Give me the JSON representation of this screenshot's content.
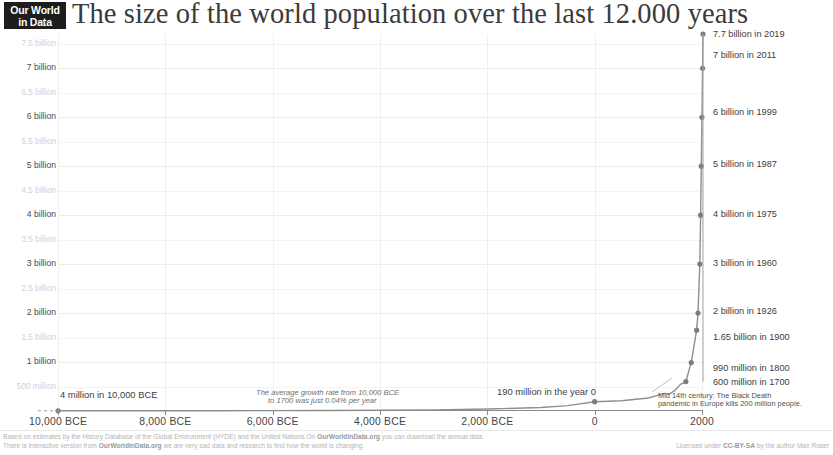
{
  "brand": {
    "logo_line1": "Our World",
    "logo_line2": "in Data"
  },
  "header": {
    "title": "The size of the world population over the last 12.000 years"
  },
  "chart_data": {
    "type": "line",
    "title": "The size of the world population over the last 12.000 years",
    "xlabel": "",
    "ylabel": "",
    "xlim": [
      -10000,
      2019
    ],
    "ylim": [
      0,
      7700000000
    ],
    "grid": true,
    "legend": "none",
    "x_ticks": [
      {
        "value": -10000,
        "label": "10,000 BCE"
      },
      {
        "value": -8000,
        "label": "8,000 BCE"
      },
      {
        "value": -6000,
        "label": "6,000 BCE"
      },
      {
        "value": -4000,
        "label": "4,000 BCE"
      },
      {
        "value": -2000,
        "label": "2,000 BCE"
      },
      {
        "value": 0,
        "label": "0"
      },
      {
        "value": 2000,
        "label": "2000"
      }
    ],
    "y_ticks": [
      {
        "value": 7500000000,
        "label": "7.5 billion",
        "minor": true
      },
      {
        "value": 7000000000,
        "label": "7 billion",
        "minor": false
      },
      {
        "value": 6500000000,
        "label": "6.5 billion",
        "minor": true
      },
      {
        "value": 6000000000,
        "label": "6 billion",
        "minor": false
      },
      {
        "value": 5500000000,
        "label": "5.5 billion",
        "minor": true
      },
      {
        "value": 5000000000,
        "label": "5 billion",
        "minor": false
      },
      {
        "value": 4500000000,
        "label": "4.5 billion",
        "minor": true
      },
      {
        "value": 4000000000,
        "label": "4 billion",
        "minor": false
      },
      {
        "value": 3500000000,
        "label": "3.5 billion",
        "minor": true
      },
      {
        "value": 3000000000,
        "label": "3 billion",
        "minor": false
      },
      {
        "value": 2500000000,
        "label": "2.5 billion",
        "minor": true
      },
      {
        "value": 2000000000,
        "label": "2 billion",
        "minor": false
      },
      {
        "value": 1500000000,
        "label": "1.5 billion",
        "minor": true
      },
      {
        "value": 1000000000,
        "label": "1 billion",
        "minor": false
      },
      {
        "value": 500000000,
        "label": "500 million",
        "minor": true
      }
    ],
    "series": [
      {
        "name": "World population",
        "color": "#8f8f8f",
        "points": [
          {
            "x": -10000,
            "y": 4000000
          },
          {
            "x": -9000,
            "y": 4500000
          },
          {
            "x": -8000,
            "y": 5100000
          },
          {
            "x": -7000,
            "y": 6000000
          },
          {
            "x": -6000,
            "y": 7700000
          },
          {
            "x": -5000,
            "y": 10400000
          },
          {
            "x": -4000,
            "y": 15000000
          },
          {
            "x": -3000,
            "y": 23000000
          },
          {
            "x": -2000,
            "y": 40000000
          },
          {
            "x": -1000,
            "y": 72000000
          },
          {
            "x": -500,
            "y": 110000000
          },
          {
            "x": 0,
            "y": 190000000
          },
          {
            "x": 500,
            "y": 210000000
          },
          {
            "x": 1000,
            "y": 265000000
          },
          {
            "x": 1300,
            "y": 360000000
          },
          {
            "x": 1400,
            "y": 350000000
          },
          {
            "x": 1500,
            "y": 425000000
          },
          {
            "x": 1600,
            "y": 545000000
          },
          {
            "x": 1700,
            "y": 600000000
          },
          {
            "x": 1800,
            "y": 990000000
          },
          {
            "x": 1900,
            "y": 1650000000
          },
          {
            "x": 1926,
            "y": 2000000000
          },
          {
            "x": 1960,
            "y": 3000000000
          },
          {
            "x": 1975,
            "y": 4000000000
          },
          {
            "x": 1987,
            "y": 5000000000
          },
          {
            "x": 1999,
            "y": 6000000000
          },
          {
            "x": 2011,
            "y": 7000000000
          },
          {
            "x": 2019,
            "y": 7700000000
          }
        ]
      }
    ],
    "markers": [
      {
        "x": -10000,
        "y": 4000000
      },
      {
        "x": 0,
        "y": 190000000
      },
      {
        "x": 1700,
        "y": 600000000
      },
      {
        "x": 1800,
        "y": 990000000
      },
      {
        "x": 1900,
        "y": 1650000000
      },
      {
        "x": 1926,
        "y": 2000000000
      },
      {
        "x": 1960,
        "y": 3000000000
      },
      {
        "x": 1975,
        "y": 4000000000
      },
      {
        "x": 1987,
        "y": 5000000000
      },
      {
        "x": 1999,
        "y": 6000000000
      },
      {
        "x": 2011,
        "y": 7000000000
      },
      {
        "x": 2019,
        "y": 7700000000
      }
    ],
    "annotations": [
      {
        "id": "a-2019",
        "text": "7.7 billion in 2019",
        "x": 2019,
        "y": 7700000000
      },
      {
        "id": "a-2011",
        "text": "7 billion in 2011",
        "x": 2011,
        "y": 7000000000
      },
      {
        "id": "a-1999",
        "text": "6 billion in 1999",
        "x": 1999,
        "y": 6000000000
      },
      {
        "id": "a-1987",
        "text": "5 billion in 1987",
        "x": 1987,
        "y": 5000000000
      },
      {
        "id": "a-1975",
        "text": "4 billion in 1975",
        "x": 1975,
        "y": 4000000000
      },
      {
        "id": "a-1960",
        "text": "3 billion in 1960",
        "x": 1960,
        "y": 3000000000
      },
      {
        "id": "a-1926",
        "text": "2 billion in 1926",
        "x": 1926,
        "y": 2000000000
      },
      {
        "id": "a-1900",
        "text": "1.65 billion in 1900",
        "x": 1900,
        "y": 1650000000
      },
      {
        "id": "a-1800",
        "text": "990 million in 1800",
        "x": 1800,
        "y": 990000000
      },
      {
        "id": "a-1700",
        "text": "600 million in 1700",
        "x": 1700,
        "y": 600000000
      },
      {
        "id": "a-start",
        "text": "4 million in 10,000 BCE",
        "x": -10000,
        "y": 4000000
      },
      {
        "id": "a-year0",
        "text": "190 million in the year 0",
        "x": 0,
        "y": 190000000
      },
      {
        "id": "a-growth-line1",
        "text": "The average growth rate from 10,000 BCE",
        "x": -4500,
        "y": 0
      },
      {
        "id": "a-growth-line2",
        "text": "to 1700 was just 0.04% per year",
        "x": -4500,
        "y": 0
      },
      {
        "id": "a-plague-line1",
        "text": "Mid 14th century: The Black Death",
        "x": 1350,
        "y": 360000000
      },
      {
        "id": "a-plague-line2",
        "text": "pandemic in Europe kills 200 million people.",
        "x": 1350,
        "y": 360000000
      }
    ]
  },
  "footer": {
    "line1_left_a": "Based on estimates by the History Database of the Global Environment (HYDE) and the United Nations.",
    "line1_left_b": "On ",
    "line1_brand": "OurWorldInData.org",
    "line1_left_c": " you can download the annual data.",
    "line2_left_a": "There is interactive version from ",
    "line2_brand": "OurWorldInData.org",
    "line2_left_b": " we are very sad data and research to find how the world is changing.",
    "line2_right_a": "Licensed under ",
    "line2_right_license": "CC-BY-SA",
    "line2_right_b": " by the author Max Roser"
  }
}
